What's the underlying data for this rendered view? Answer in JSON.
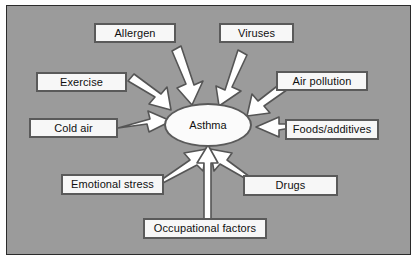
{
  "diagram": {
    "background_color": "#9b9b9b",
    "border_color": "#2b2b2b",
    "box_fill_color": "#f7f7f7",
    "box_border_color": "#5a5a5a",
    "arrow_fill_color": "#ffffff",
    "arrow_outline_color": "#555555",
    "center": {
      "label": "Asthma",
      "shape": "ellipse"
    },
    "nodes": [
      {
        "id": "allergen",
        "label": "Allergen"
      },
      {
        "id": "viruses",
        "label": "Viruses"
      },
      {
        "id": "exercise",
        "label": "Exercise"
      },
      {
        "id": "air-pollution",
        "label": "Air pollution"
      },
      {
        "id": "cold-air",
        "label": "Cold air"
      },
      {
        "id": "foods-additives",
        "label": "Foods/additives"
      },
      {
        "id": "emotional-stress",
        "label": "Emotional stress"
      },
      {
        "id": "drugs",
        "label": "Drugs"
      },
      {
        "id": "occupational-factors",
        "label": "Occupational factors"
      }
    ]
  }
}
